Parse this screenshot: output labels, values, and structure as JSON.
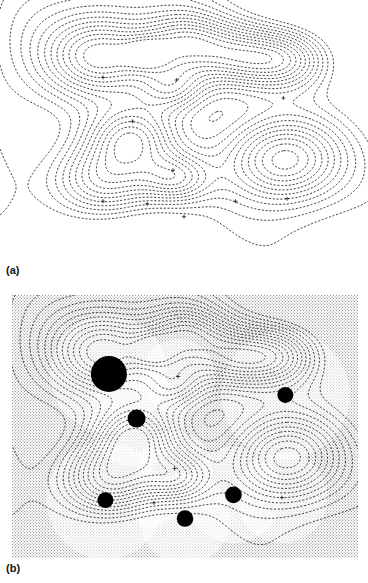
{
  "figure": {
    "type": "contour-map-pair",
    "background_color": "#ffffff",
    "contour_color": "#1a1a1a",
    "blob_color": "#000000",
    "stipple_color": "#9a9a9a"
  },
  "panels": [
    {
      "id": "a",
      "label": "(a)",
      "shaded_background": false,
      "filled_blobs": false,
      "marker_glyph": "+",
      "bbox": {
        "x": 0,
        "y": 0,
        "w": 368,
        "h": 258
      }
    },
    {
      "id": "b",
      "label": "(b)",
      "shaded_background": true,
      "filled_blobs": true,
      "marker_glyph": "+",
      "bbox": {
        "x": 12,
        "y": 295,
        "w": 346,
        "h": 263
      }
    }
  ],
  "chart_data": {
    "type": "heatmap",
    "title": "",
    "subtitle": "",
    "xlabel": "",
    "ylabel": "",
    "tick_labels": {
      "x": [],
      "y": []
    },
    "grid": false,
    "legend": null,
    "annotations": [
      "(a)",
      "(b)"
    ],
    "contour_style": "dashed",
    "contour_interval": 1,
    "levels": [
      1,
      2,
      3,
      4,
      5,
      6,
      7,
      8,
      9,
      10,
      11,
      12
    ],
    "panel_a": {
      "xlim": [
        0,
        100
      ],
      "ylim": [
        0,
        100
      ],
      "peaks": [
        {
          "x": 28,
          "y": 70,
          "amp": 11.0,
          "sigma": 11.0,
          "marker": "+"
        },
        {
          "x": 36,
          "y": 53,
          "amp": 9.5,
          "sigma": 9.0,
          "marker": "+"
        },
        {
          "x": 48,
          "y": 69,
          "amp": 7.5,
          "sigma": 7.0,
          "marker": "+"
        },
        {
          "x": 77,
          "y": 62,
          "amp": 11.5,
          "sigma": 12.0,
          "marker": "+"
        },
        {
          "x": 28,
          "y": 22,
          "amp": 10.5,
          "sigma": 11.0,
          "marker": "+"
        },
        {
          "x": 40,
          "y": 21,
          "amp": 5.0,
          "sigma": 4.5,
          "marker": "+"
        },
        {
          "x": 47,
          "y": 34,
          "amp": 7.5,
          "sigma": 7.0,
          "marker": "+"
        },
        {
          "x": 50,
          "y": 16,
          "amp": 9.0,
          "sigma": 8.5,
          "marker": "+"
        },
        {
          "x": 64,
          "y": 22,
          "amp": 9.0,
          "sigma": 9.0,
          "marker": "+"
        },
        {
          "x": 78,
          "y": 23,
          "amp": 9.0,
          "sigma": 8.5,
          "marker": "+"
        }
      ]
    },
    "panel_b": {
      "xlim": [
        0,
        100
      ],
      "ylim": [
        0,
        100
      ],
      "peaks": [
        {
          "x": 28,
          "y": 70,
          "amp": 13.5,
          "sigma": 11.0,
          "marker": "+",
          "blob_r": 5.2
        },
        {
          "x": 36,
          "y": 53,
          "amp": 10.5,
          "sigma": 9.0,
          "marker": "+",
          "blob_r": 2.6
        },
        {
          "x": 48,
          "y": 69,
          "amp": 7.5,
          "sigma": 7.0,
          "marker": "+",
          "blob_r": 0
        },
        {
          "x": 79,
          "y": 62,
          "amp": 11.5,
          "sigma": 12.0,
          "marker": "+",
          "blob_r": 2.3
        },
        {
          "x": 27,
          "y": 22,
          "amp": 10.5,
          "sigma": 11.0,
          "marker": "+",
          "blob_r": 2.3
        },
        {
          "x": 41,
          "y": 21,
          "amp": 5.0,
          "sigma": 4.5,
          "marker": "+",
          "blob_r": 0
        },
        {
          "x": 47,
          "y": 34,
          "amp": 7.5,
          "sigma": 7.0,
          "marker": "+",
          "blob_r": 0
        },
        {
          "x": 50,
          "y": 15,
          "amp": 9.5,
          "sigma": 8.5,
          "marker": "+",
          "blob_r": 2.4
        },
        {
          "x": 64,
          "y": 24,
          "amp": 9.5,
          "sigma": 9.0,
          "marker": "+",
          "blob_r": 2.4
        },
        {
          "x": 78,
          "y": 23,
          "amp": 8.5,
          "sigma": 8.5,
          "marker": "+",
          "blob_r": 0
        }
      ]
    }
  }
}
